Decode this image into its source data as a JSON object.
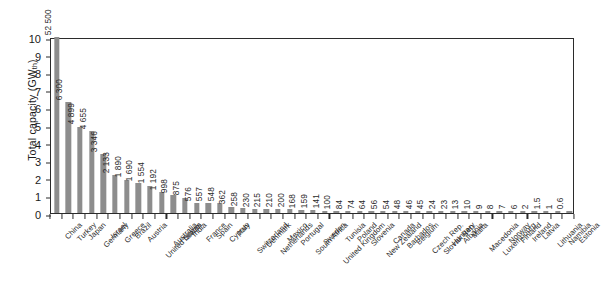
{
  "chart_data": {
    "type": "bar",
    "title": "",
    "subtitle": "",
    "xlabel": "",
    "ylabel": "Total capacity (GWth)",
    "ylabel_main": "Total capacity (GW",
    "ylabel_sub": "th",
    "ylabel_close": ")",
    "ylim": [
      0,
      10
    ],
    "ytick_labels": [
      "10",
      "9",
      "8",
      "7",
      "6",
      "5",
      "4",
      "3",
      "2",
      "1",
      "0"
    ],
    "ytick_values": [
      10,
      9,
      8,
      7,
      6,
      5,
      4,
      3,
      2,
      1,
      0
    ],
    "grid": false,
    "legend": "none",
    "bar_color": "#8d8d8d",
    "axis_color": "#2b2b2b",
    "note": "First bar (China, 52 500) is clipped at the top of the 0-10 axis; data labels are printed in GW units of the underlying table",
    "value_unit": "GWth",
    "categories": [
      "China",
      "Turkey",
      "Japan",
      "Germany",
      "Israel",
      "Greece",
      "Brazil",
      "Austria",
      "United States",
      "Australia",
      "Taiwan",
      "India",
      "France",
      "Spain",
      "Cyprus",
      "Italy",
      "Switzerland",
      "Denmark",
      "Netherlands",
      "Mexico",
      "Portugal",
      "South Africa",
      "Sweden",
      "United Kingdom",
      "Tunisia",
      "Poland",
      "Slovenia",
      "New Zealand",
      "Canada",
      "Barbados",
      "Belgium",
      "Czech Rep.",
      "Slovak Rep.",
      "Hungary",
      "Albania",
      "Malta",
      "Macedonia",
      "Luxembourg",
      "Norway",
      "Finland",
      "Ireland",
      "Latvia",
      "Lithuania",
      "Namibia",
      "Estonia"
    ],
    "values": [
      52500,
      6300,
      4899,
      4655,
      3346,
      2133,
      1890,
      1690,
      1554,
      1192,
      998,
      875,
      576,
      557,
      548,
      362,
      258,
      230,
      215,
      210,
      200,
      168,
      159,
      141,
      100,
      84,
      74,
      64,
      56,
      54,
      48,
      46,
      45,
      24,
      23,
      13,
      10,
      9,
      8,
      7,
      6,
      2,
      1.5,
      1,
      0.6
    ],
    "value_labels": [
      "52 500",
      "6 300",
      "4 899",
      "4 655",
      "3 346",
      "2 133",
      "1 890",
      "1 690",
      "1 554",
      "1 192",
      "998",
      "875",
      "576",
      "557",
      "548",
      "362",
      "258",
      "230",
      "215",
      "210",
      "200",
      "168",
      "159",
      "141",
      "100",
      "84",
      "74",
      "64",
      "56",
      "54",
      "48",
      "46",
      "45",
      "24",
      "23",
      "13",
      "10",
      "9",
      "8",
      "7",
      "6",
      "2",
      "1.5",
      "1",
      "0.6"
    ],
    "plot_scale_max": 6300,
    "plot_scale_note": "bar heights drawn on a 0-10 axis where 6 300 maps to 6.3"
  }
}
